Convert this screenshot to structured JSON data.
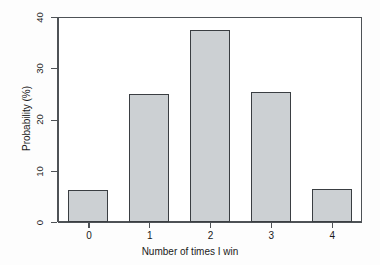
{
  "chart_data": {
    "type": "bar",
    "title": "",
    "subtitle": "",
    "categories": [
      "0",
      "1",
      "2",
      "3",
      "4"
    ],
    "values": [
      6.25,
      25.0,
      37.5,
      25.3,
      6.5
    ],
    "series": [
      {
        "name": "Probability",
        "values": [
          6.25,
          25.0,
          37.5,
          25.3,
          6.5
        ]
      }
    ],
    "xlabel": "Number of times I win",
    "ylabel": "Probability (%)",
    "ylim": [
      0,
      40
    ],
    "xlim": [
      0,
      5
    ],
    "y_ticks": [
      "0",
      "10",
      "20",
      "30",
      "40"
    ],
    "y_tick_values": [
      0,
      10,
      20,
      30,
      40
    ],
    "x_ticks": [
      "0",
      "1",
      "2",
      "3",
      "4"
    ],
    "grid": false,
    "legend": false,
    "legend_position": "none",
    "annotations": [],
    "style": {
      "bar_fill": "#ccd0d3",
      "bar_border": "#3a3e42",
      "axis_color": "#4e5256",
      "plot_background": "#ffffff",
      "figure_background": "#fdfdfd",
      "frame": "box"
    }
  }
}
